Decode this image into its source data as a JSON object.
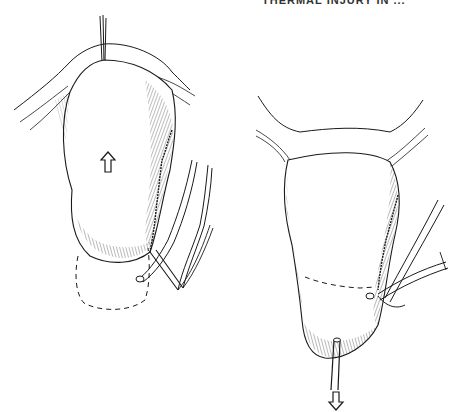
{
  "page": {
    "header_text": "THERMAL INJURY IN ...",
    "background": "#ffffff",
    "ink_color": "#1a1a1a"
  },
  "figures": [
    {
      "id": "left-panel",
      "description": "Organ retracted upward with traction suture at top; dashed outline shows original position below; vessels branching at lower right",
      "arrow": {
        "direction": "up",
        "label": "upward-arrow"
      }
    },
    {
      "id": "right-panel",
      "description": "Organ pulled downward by tube at bottom; dashed transection line across lower third; vessels at right",
      "arrow": {
        "direction": "down",
        "label": "downward-arrow"
      }
    }
  ]
}
